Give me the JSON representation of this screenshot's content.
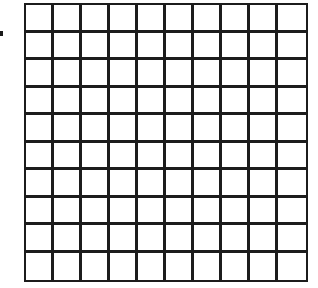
{
  "diagram": {
    "type": "grid",
    "rows": 10,
    "columns": 10,
    "line_color": "#1c1c1c",
    "fill_color": "#ffffff",
    "marker": {
      "shape": "small-square",
      "color": "#1a1a1a"
    }
  }
}
